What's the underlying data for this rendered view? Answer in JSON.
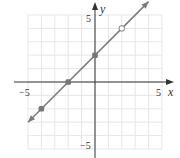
{
  "chart_data": {
    "type": "line",
    "title": "",
    "xlabel": "x",
    "ylabel": "y",
    "xlim": [
      -5,
      5
    ],
    "ylim": [
      -5,
      5
    ],
    "grid": true,
    "tick_labels": {
      "x_neg": "−5",
      "x_pos": "5",
      "y_pos": "5",
      "y_neg": "−5"
    },
    "series": [
      {
        "name": "y = x + 2",
        "line": {
          "from": [
            -5,
            -3
          ],
          "to": [
            4,
            6
          ]
        },
        "points": [
          {
            "x": -4,
            "y": -2,
            "style": "filled"
          },
          {
            "x": -2,
            "y": 0,
            "style": "filled"
          },
          {
            "x": 0,
            "y": 2,
            "style": "filled"
          },
          {
            "x": 2,
            "y": 4,
            "style": "open"
          }
        ]
      }
    ],
    "colors": {
      "line": "#7a7a7a",
      "point": "#777777",
      "grid": "#e6e6e6",
      "axis": "#333333"
    }
  }
}
